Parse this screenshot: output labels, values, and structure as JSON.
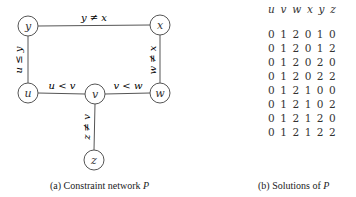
{
  "network": {
    "nodes": [
      {
        "id": "y",
        "label": "y",
        "x": 28,
        "y": 26
      },
      {
        "id": "x",
        "label": "x",
        "x": 160,
        "y": 25
      },
      {
        "id": "u",
        "label": "u",
        "x": 28,
        "y": 93
      },
      {
        "id": "v",
        "label": "v",
        "x": 95,
        "y": 94
      },
      {
        "id": "w",
        "label": "w",
        "x": 160,
        "y": 93
      },
      {
        "id": "z",
        "label": "z",
        "x": 94,
        "y": 160
      }
    ],
    "edges": [
      {
        "from": "y",
        "to": "x",
        "label": "y ≠ x"
      },
      {
        "from": "u",
        "to": "y",
        "label": "u ≤ y"
      },
      {
        "from": "x",
        "to": "w",
        "label": "w ≠ x"
      },
      {
        "from": "u",
        "to": "v",
        "label": "u < v"
      },
      {
        "from": "v",
        "to": "w",
        "label": "v < w"
      },
      {
        "from": "v",
        "to": "z",
        "label": "z ≠ v"
      }
    ],
    "caption_prefix": "(a)  Constraint network ",
    "caption_var": "P"
  },
  "solutions": {
    "header": "u v w x y z",
    "rows": [
      "0 1 2 0 1 0",
      "0 1 2 0 1 2",
      "0 1 2 0 2 0",
      "0 1 2 0 2 2",
      "0 1 2 1 0 0",
      "0 1 2 1 0 2",
      "0 1 2 1 2 0",
      "0 1 2 1 2 2"
    ],
    "caption_prefix": "(b)  Solutions of ",
    "caption_var": "P"
  }
}
